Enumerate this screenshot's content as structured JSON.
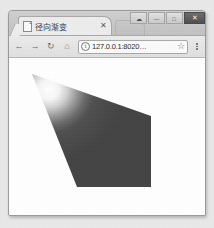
{
  "window": {
    "controls": [
      {
        "name": "minimize-to-tray-button",
        "glyph": "☁"
      },
      {
        "name": "minimize-button",
        "glyph": "—"
      },
      {
        "name": "maximize-button",
        "glyph": "□"
      },
      {
        "name": "close-button",
        "glyph": "✕"
      }
    ]
  },
  "tab": {
    "title": "径向渐变",
    "close_label": "✕",
    "favicon_name": "page-favicon"
  },
  "toolbar": {
    "back_glyph": "←",
    "forward_glyph": "→",
    "reload_glyph": "↻",
    "home_glyph": "⌂",
    "info_glyph": "i",
    "star_glyph": "☆",
    "url_value": "127.0.0.1:8020…",
    "url_placeholder": "搜索或输入网址"
  },
  "content": {
    "canvas_background": "#ffffff",
    "shape_name": "radial-gradient-polygon",
    "polygon_points": "23,16 142,58 142,129 68,129",
    "gradient": {
      "type": "radial",
      "center_x": "14%",
      "center_y": "14%",
      "radius": "62%",
      "stops": [
        {
          "offset": "0%",
          "color": "#ffffff"
        },
        {
          "offset": "16%",
          "color": "#f2f2f2"
        },
        {
          "offset": "34%",
          "color": "#b9b9b9"
        },
        {
          "offset": "52%",
          "color": "#6f6f6f"
        },
        {
          "offset": "70%",
          "color": "#4c4c4c"
        },
        {
          "offset": "100%",
          "color": "#444444"
        }
      ]
    }
  },
  "colors": {
    "page_background": "#e9e9e9",
    "window_chrome": "#cfcfcf",
    "toolbar": "#e6e6e6",
    "active_tab": "#ededed",
    "shape_dark": "#454545",
    "shape_light": "#ffffff"
  }
}
